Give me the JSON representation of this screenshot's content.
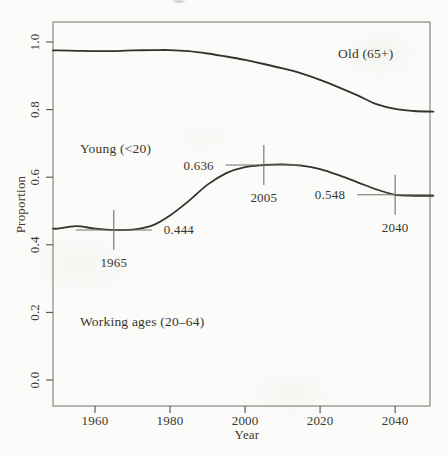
{
  "chart_data": {
    "type": "line",
    "title": "",
    "xlabel": "Year",
    "ylabel": "Proportion",
    "xlim": [
      1950,
      2050
    ],
    "ylim": [
      0.0,
      1.0
    ],
    "grid": false,
    "legend": "none (bands labeled inline)",
    "x_ticks": [
      {
        "label": "1960",
        "value": 1960
      },
      {
        "label": "1980",
        "value": 1980
      },
      {
        "label": "2000",
        "value": 2000
      },
      {
        "label": "2020",
        "value": 2020
      },
      {
        "label": "2040",
        "value": 2040
      }
    ],
    "y_ticks": [
      {
        "label": "0.0",
        "value": 0.0
      },
      {
        "label": "0.2",
        "value": 0.2
      },
      {
        "label": "0.4",
        "value": 0.4
      },
      {
        "label": "0.6",
        "value": 0.6
      },
      {
        "label": "0.8",
        "value": 0.8
      },
      {
        "label": "1.0",
        "value": 1.0
      }
    ],
    "x": [
      1950,
      1955,
      1960,
      1965,
      1970,
      1975,
      1980,
      1985,
      1990,
      1995,
      2000,
      2005,
      2010,
      2015,
      2020,
      2025,
      2030,
      2035,
      2040,
      2045,
      2050
    ],
    "series": [
      {
        "name": "Proportion aged under 65 (boundary between Young and Old bands)",
        "values": [
          0.975,
          0.974,
          0.973,
          0.973,
          0.975,
          0.976,
          0.976,
          0.973,
          0.966,
          0.957,
          0.947,
          0.935,
          0.922,
          0.907,
          0.888,
          0.866,
          0.842,
          0.816,
          0.802,
          0.796,
          0.794
        ]
      },
      {
        "name": "Proportion in working ages 20–64 (boundary between Working and Young bands)",
        "values": [
          0.448,
          0.455,
          0.448,
          0.444,
          0.445,
          0.456,
          0.487,
          0.53,
          0.578,
          0.612,
          0.63,
          0.636,
          0.638,
          0.634,
          0.624,
          0.606,
          0.585,
          0.564,
          0.548,
          0.545,
          0.545
        ]
      }
    ],
    "band_labels": {
      "old": "Old (65+)",
      "young": "Young (<20)",
      "working": "Working ages (20–64)"
    },
    "annotations": [
      {
        "year": 1965,
        "value": 0.444,
        "value_label": "0.444",
        "year_label": "1965",
        "value_label_side": "right"
      },
      {
        "year": 2005,
        "value": 0.636,
        "value_label": "0.636",
        "year_label": "2005",
        "value_label_side": "left"
      },
      {
        "year": 2040,
        "value": 0.548,
        "value_label": "0.548",
        "year_label": "2040",
        "value_label_side": "left"
      }
    ],
    "colors": {
      "curve": "#34322d",
      "frame": "#8a8880",
      "tick": "#55534d",
      "marker_cross": "#716f69",
      "text": "#3b392f",
      "paper": "#fbfbf9"
    }
  }
}
